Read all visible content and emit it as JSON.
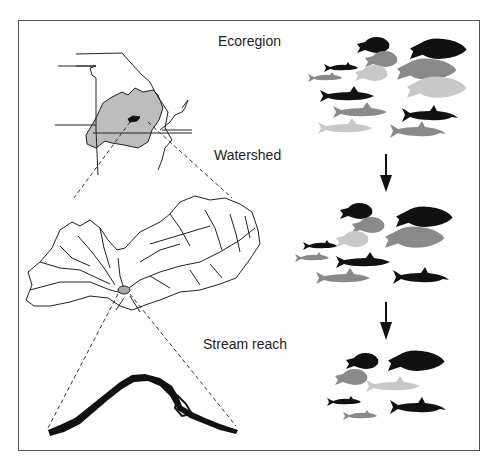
{
  "diagram": {
    "scales": [
      {
        "id": "ecoregion",
        "label": "Ecoregion"
      },
      {
        "id": "watershed",
        "label": "Watershed"
      },
      {
        "id": "stream_reach",
        "label": "Stream reach"
      }
    ],
    "colors": {
      "black": "#111111",
      "dark_gray": "#8a8a8a",
      "light_gray": "#c8c8c8",
      "ecoregion_fill": "#bdbdbd",
      "watershed_reach": "#a8a8a8",
      "frame": "#555555"
    },
    "fish_groups": {
      "ecoregion_count": 14,
      "watershed_count": 10,
      "stream_reach_count": 7
    }
  }
}
